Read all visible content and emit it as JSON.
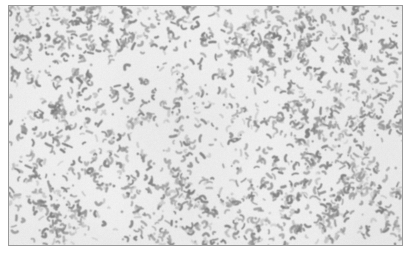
{
  "page": {
    "width": 411,
    "height": 254,
    "background_color": "#ffffff",
    "kind": "scanned-photomicrograph-plate",
    "caption_text": "",
    "has_visible_text": false,
    "has_scale_bar": false,
    "has_labels": false
  },
  "plate": {
    "name": "photomicrograph",
    "left": 8,
    "top": 5,
    "width": 395,
    "height": 241,
    "border_color": "#9a9a9a",
    "border_width": 1
  },
  "micrograph": {
    "subject": "bacterial smear, dense field of small rod, comma and coccoid shaped cells",
    "field_background_color": "#eeeeee",
    "particle_color_dark": "#7d7d7d",
    "particle_color_mid": "#949494",
    "particle_color_light": "#b0b0b0",
    "background_tone_min": "#e4e4e4",
    "background_tone_max": "#f3f3f3",
    "blur_radius_px": 0.55,
    "grain_strength": 9,
    "seed": 20483,
    "particle_count": 2150,
    "particle_length_min": 1.6,
    "particle_length_max": 6.4,
    "particle_thickness_min": 1.5,
    "particle_thickness_max": 2.9,
    "curvature_max": 1.25,
    "clump_fraction": 0.3,
    "density_hotspots": [
      {
        "x": 0.09,
        "y": 0.1,
        "radius": 0.3,
        "weight": 0.95
      },
      {
        "x": 0.33,
        "y": 0.07,
        "radius": 0.26,
        "weight": 0.8
      },
      {
        "x": 0.63,
        "y": 0.12,
        "radius": 0.3,
        "weight": 1.0
      },
      {
        "x": 0.88,
        "y": 0.2,
        "radius": 0.28,
        "weight": 0.92
      },
      {
        "x": 0.14,
        "y": 0.46,
        "radius": 0.27,
        "weight": 0.7
      },
      {
        "x": 0.5,
        "y": 0.4,
        "radius": 0.24,
        "weight": 0.52
      },
      {
        "x": 0.82,
        "y": 0.52,
        "radius": 0.27,
        "weight": 0.74
      },
      {
        "x": 0.1,
        "y": 0.82,
        "radius": 0.28,
        "weight": 0.86
      },
      {
        "x": 0.4,
        "y": 0.78,
        "radius": 0.26,
        "weight": 0.62
      },
      {
        "x": 0.7,
        "y": 0.88,
        "radius": 0.28,
        "weight": 0.78
      },
      {
        "x": 0.95,
        "y": 0.76,
        "radius": 0.24,
        "weight": 0.7
      }
    ],
    "density_coldspots": [
      {
        "x": 0.44,
        "y": 0.24,
        "radius": 0.14,
        "weight": 0.55
      },
      {
        "x": 0.24,
        "y": 0.62,
        "radius": 0.13,
        "weight": 0.45
      },
      {
        "x": 0.57,
        "y": 0.63,
        "radius": 0.15,
        "weight": 0.5
      },
      {
        "x": 0.3,
        "y": 0.92,
        "radius": 0.12,
        "weight": 0.4
      }
    ]
  }
}
